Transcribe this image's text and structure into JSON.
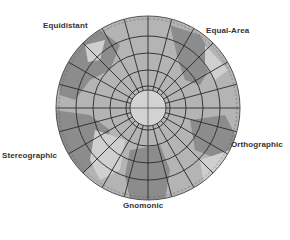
{
  "labels": {
    "equidistant": "Equidistant",
    "equal_area": "Equal-Area",
    "stereographic": "Stereographic",
    "orthographic": "Orthographic",
    "gnomonic": "Gnomonic"
  },
  "colors": {
    "background": "#ffffff",
    "ocean": "#b4b4b4",
    "land": "#8c8c8c",
    "land_light": "#cfcfcf",
    "grid": "#2a2a2a",
    "label": "#333333"
  },
  "globe": {
    "center_x": 148,
    "center_y": 108,
    "radius": 92,
    "meridian_count": 24,
    "parallel_radii": [
      22,
      38,
      55,
      72
    ]
  }
}
